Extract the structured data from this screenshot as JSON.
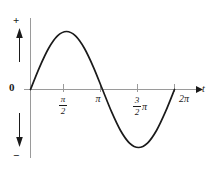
{
  "figure": {
    "title": "",
    "background_color": "#ffffff",
    "curve_color": "#1a1a1a",
    "axis_color": "#9a9a9a",
    "text_color": "#1a1a1a"
  },
  "axes": {
    "x_axis_label": "t",
    "origin_label": "0",
    "positive_direction_label": "+",
    "negative_direction_label": "−",
    "tick_labels": [
      {
        "id": "pi-half",
        "numerator": "π",
        "denominator": "2",
        "suffix": ""
      },
      {
        "id": "pi",
        "text": "π"
      },
      {
        "id": "3pi-half",
        "numerator": "3",
        "denominator": "2",
        "suffix": "π"
      },
      {
        "id": "2pi",
        "text": "2π"
      }
    ]
  },
  "chart_data": {
    "type": "line",
    "title": "",
    "xlabel": "t",
    "ylabel": "",
    "xlim": [
      0,
      6.283185307179586
    ],
    "ylim": [
      -1.15,
      1.15
    ],
    "grid": false,
    "legend": null,
    "xtick_values": [
      1.5707963267948966,
      3.141592653589793,
      4.71238898038469,
      6.283185307179586
    ],
    "xtick_labels": [
      "π/2",
      "π",
      "(3/2)π",
      "2π"
    ],
    "ytick_values": [],
    "ytick_labels": [],
    "annotations": [
      {
        "text": "+",
        "position": "upper-left-axis",
        "meaning": "positive direction arrow"
      },
      {
        "text": "−",
        "position": "lower-left-axis",
        "meaning": "negative direction arrow"
      },
      {
        "text": "0",
        "position": "origin"
      }
    ],
    "series": [
      {
        "name": "sine",
        "expression": "sin(t)",
        "x": [
          0,
          0.3926990816987241,
          0.7853981633974483,
          1.1780972450961724,
          1.5707963267948966,
          1.9634954084936207,
          2.356194490192345,
          2.748893571891069,
          3.141592653589793,
          3.5342917352885173,
          3.9269908169872414,
          4.319689898685965,
          4.71238898038469,
          5.105088062083414,
          5.497787143782138,
          5.8904862254008625,
          6.283185307179586
        ],
        "y": [
          0,
          0.3827,
          0.7071,
          0.9239,
          1.0,
          0.9239,
          0.7071,
          0.3827,
          0,
          -0.3827,
          -0.7071,
          -0.9239,
          -1.0,
          -0.9239,
          -0.7071,
          -0.3827,
          0
        ]
      }
    ]
  }
}
